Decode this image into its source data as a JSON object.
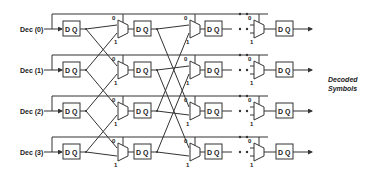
{
  "diagram": {
    "title": "",
    "inputs": [
      {
        "label": "Dec (0)"
      },
      {
        "label": "Dec (1)"
      },
      {
        "label": "Dec (2)"
      },
      {
        "label": "Dec (3)"
      }
    ],
    "register_label": "D Q",
    "mux_input_labels": {
      "top": "0",
      "bottom": "1"
    },
    "output_label_line1": "Decoded",
    "output_label_line2": "Symbols",
    "ellipsis": "• •"
  }
}
